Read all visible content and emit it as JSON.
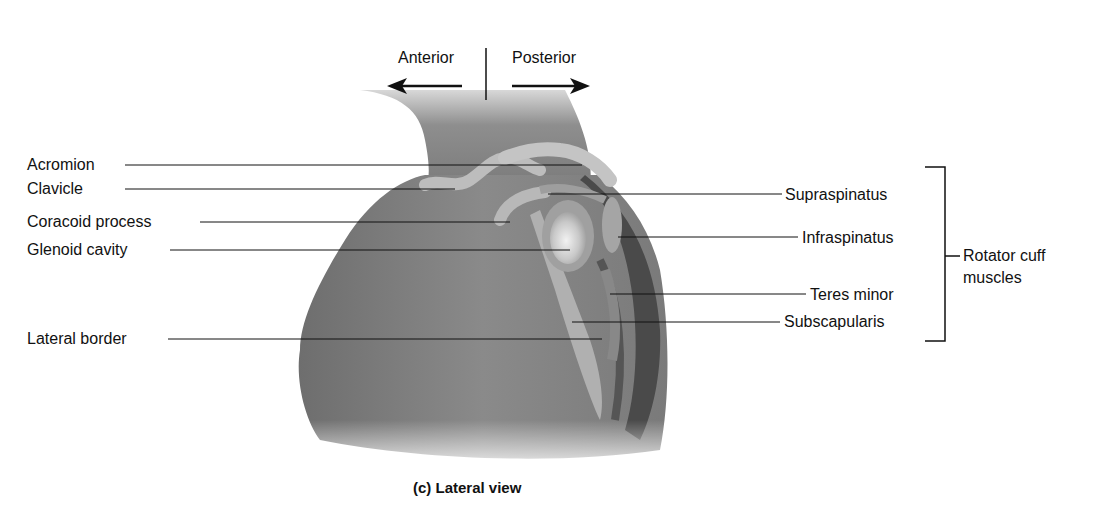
{
  "figure": {
    "caption": "(c) Lateral view",
    "orientation": {
      "anterior": "Anterior",
      "posterior": "Posterior"
    },
    "left_labels": [
      {
        "id": "acromion",
        "text": "Acromion"
      },
      {
        "id": "clavicle",
        "text": "Clavicle"
      },
      {
        "id": "coracoid-process",
        "text": "Coracoid process"
      },
      {
        "id": "glenoid-cavity",
        "text": "Glenoid cavity"
      },
      {
        "id": "lateral-border",
        "text": "Lateral border"
      }
    ],
    "right_labels": [
      {
        "id": "supraspinatus",
        "text": "Supraspinatus"
      },
      {
        "id": "infraspinatus",
        "text": "Infraspinatus"
      },
      {
        "id": "teres-minor",
        "text": "Teres minor"
      },
      {
        "id": "subscapularis",
        "text": "Subscapularis"
      }
    ],
    "group_label": {
      "line1": "Rotator cuff",
      "line2": "muscles"
    }
  }
}
